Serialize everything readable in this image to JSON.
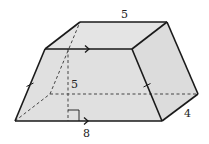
{
  "diagram": {
    "type": "trapezoidal-prism",
    "colors": {
      "face_fill": "#e2e2e2",
      "edge": "#1a1a1a",
      "hidden_edge": "#444444",
      "background": "#ffffff"
    },
    "vertices": {
      "front_bottom_left": [
        15,
        121
      ],
      "front_bottom_right": [
        162,
        121
      ],
      "front_top_left": [
        45,
        49
      ],
      "front_top_right": [
        132,
        49
      ],
      "back_bottom_left": [
        50,
        94
      ],
      "back_bottom_right": [
        198,
        94
      ],
      "back_top_left": [
        80,
        22
      ],
      "back_top_right": [
        167,
        22
      ]
    },
    "labels": {
      "top_edge": "5",
      "height": "5",
      "bottom_edge": "8",
      "depth": "4"
    },
    "markings": {
      "parallel_arrows": [
        "front-top-edge",
        "front-bottom-edge"
      ],
      "congruent_ticks": [
        "front-left-slant",
        "front-right-slant"
      ],
      "right_angle": "height-to-base"
    }
  }
}
